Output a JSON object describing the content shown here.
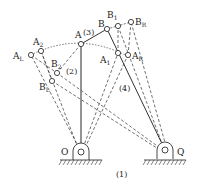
{
  "diagram": {
    "title_label": "(1)",
    "colors": {
      "stroke": "#333333",
      "solid_link": "#666666",
      "arc": "#555555",
      "background": "#ffffff"
    },
    "pivots": {
      "O": {
        "label": "O",
        "x": 81,
        "y": 152
      },
      "Q": {
        "label": "Q",
        "x": 165,
        "y": 150
      }
    },
    "points": {
      "A": {
        "label": "A",
        "x": 81,
        "y": 44
      },
      "B": {
        "label": "B",
        "x": 107,
        "y": 29
      },
      "B1": {
        "label": "B",
        "sub": "1",
        "x": 118,
        "y": 26
      },
      "BR": {
        "label": "B",
        "sub": "R",
        "x": 131,
        "y": 22
      },
      "A1": {
        "label": "A",
        "sub": "1",
        "x": 118,
        "y": 53
      },
      "AR": {
        "label": "A",
        "sub": "R",
        "x": 128,
        "y": 55
      },
      "A2": {
        "label": "A",
        "sub": "2",
        "x": 41,
        "y": 51
      },
      "AL": {
        "label": "A",
        "sub": "L",
        "x": 31,
        "y": 55
      },
      "B2": {
        "label": "B",
        "sub": "2",
        "x": 57,
        "y": 73
      },
      "BL": {
        "label": "B",
        "sub": "L",
        "x": 52,
        "y": 81
      }
    },
    "link_labels": {
      "link2": "(2)",
      "link3": "(3)",
      "link4": "(4)"
    }
  }
}
